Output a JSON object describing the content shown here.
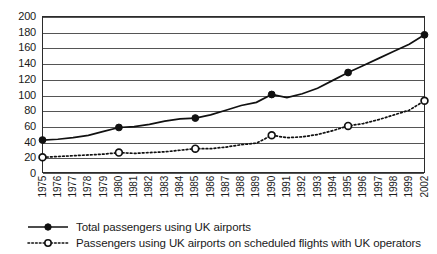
{
  "chart_data": {
    "type": "line",
    "title": "",
    "subtitle": "",
    "xlabel": "",
    "ylabel": "",
    "ylim": [
      0,
      200
    ],
    "ytick_step": 20,
    "yticks": [
      200,
      180,
      160,
      140,
      120,
      100,
      80,
      60,
      40,
      20,
      0
    ],
    "grid": true,
    "legend_position": "bottom-left",
    "categories": [
      "1975",
      "1976",
      "1977",
      "1978",
      "1979",
      "1980",
      "1981",
      "1982",
      "1983",
      "1984",
      "1985",
      "1986",
      "1987",
      "1988",
      "1989",
      "1990",
      "1991",
      "1992",
      "1993",
      "1994",
      "1995",
      "1996",
      "1997",
      "1998",
      "1999",
      "2002"
    ],
    "marker_years": [
      "1975",
      "1980",
      "1985",
      "1990",
      "1995",
      "2002"
    ],
    "series": [
      {
        "name": "Total passengers using UK airports",
        "marker": "filled-circle",
        "line_style": "solid",
        "color": "#111111",
        "values": [
          42,
          43,
          45,
          48,
          53,
          58,
          59,
          62,
          66,
          69,
          70,
          74,
          80,
          86,
          90,
          100,
          96,
          101,
          108,
          118,
          128,
          137,
          146,
          155,
          164,
          176
        ]
      },
      {
        "name": "Passengers using UK airports on scheduled flights with UK operators",
        "marker": "open-circle",
        "line_style": "dotted",
        "color": "#111111",
        "values": [
          20,
          21,
          22,
          23,
          24,
          26,
          25,
          26,
          27,
          29,
          31,
          31,
          33,
          36,
          38,
          48,
          45,
          46,
          49,
          54,
          60,
          63,
          68,
          74,
          80,
          92
        ]
      }
    ]
  },
  "legend": {
    "items": [
      {
        "label": "Total passengers using UK airports",
        "style": "solid-filled"
      },
      {
        "label": "Passengers using UK airports on scheduled flights with UK operators",
        "style": "dotted-open"
      }
    ]
  },
  "colors": {
    "axis": "#2b2b2b",
    "grid": "#555555",
    "series": "#111111",
    "background": "#ffffff"
  }
}
